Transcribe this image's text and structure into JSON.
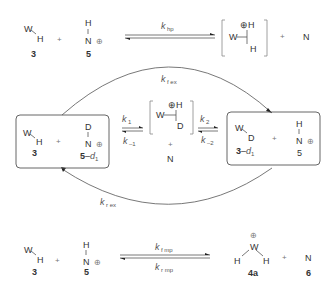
{
  "diagram": {
    "type": "reaction-scheme",
    "rows": {
      "top": {
        "reactant1": {
          "atoms": [
            "W",
            "H"
          ],
          "label": "3"
        },
        "plus1": "+",
        "reactant2": {
          "atoms": [
            "H",
            "N",
            "⊕"
          ],
          "label": "5"
        },
        "rate_constant": {
          "k": "k",
          "sub": "hp"
        },
        "product": {
          "atoms": [
            "W",
            "⊕H",
            "H"
          ],
          "bracketed": true
        },
        "plus2": "+",
        "byproduct": "N"
      },
      "middle": {
        "left_box": {
          "reactant1": {
            "atoms": [
              "W",
              "H"
            ],
            "label": "3"
          },
          "plus": "+",
          "reactant2": {
            "atoms": [
              "D",
              "N",
              "⊕"
            ],
            "label": "5",
            "label_suffix": "–",
            "label_italic": "d",
            "label_sub": "1"
          }
        },
        "step1": {
          "forward": {
            "k": "k",
            "sub": "1"
          },
          "reverse": {
            "k": "k",
            "sub": "–1"
          }
        },
        "intermediate": {
          "atoms": [
            "W",
            "⊕H",
            "D"
          ],
          "plus": "+",
          "extra": "N"
        },
        "step2": {
          "forward": {
            "k": "k",
            "sub": "2"
          },
          "reverse": {
            "k": "k",
            "sub": "–2"
          }
        },
        "right_box": {
          "reactant1": {
            "atoms": [
              "W",
              "D"
            ],
            "label": "3",
            "label_suffix": "–",
            "label_italic": "d",
            "label_sub": "1"
          },
          "plus": "+",
          "reactant2": {
            "atoms": [
              "H",
              "N",
              "⊕"
            ],
            "label": "5"
          }
        },
        "top_arc": {
          "k": "k",
          "sub": "f ex"
        },
        "bottom_arc": {
          "k": "k",
          "sub": "r ex"
        }
      },
      "bottom": {
        "reactant1": {
          "atoms": [
            "W",
            "H"
          ],
          "label": "3"
        },
        "plus1": "+",
        "reactant2": {
          "atoms": [
            "H",
            "N",
            "⊕"
          ],
          "label": "5"
        },
        "forward": {
          "k": "k",
          "sub": "f mp"
        },
        "reverse": {
          "k": "k",
          "sub": "r mp"
        },
        "product": {
          "atoms": [
            "⊕",
            "W",
            "H",
            "H"
          ],
          "label": "4a"
        },
        "plus2": "+",
        "byproduct": {
          "atom": "N",
          "label": "6"
        }
      }
    }
  }
}
